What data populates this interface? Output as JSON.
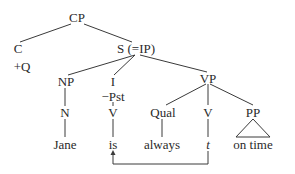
{
  "diagram": {
    "type": "syntax-tree",
    "nodes": {
      "cp": "CP",
      "c": "C",
      "c_feature": "+Q",
      "s": "S (=IP)",
      "np": "NP",
      "i": "I",
      "i_feature": "−Pst",
      "vp": "VP",
      "n": "N",
      "v_raised": "V",
      "qual": "Qual",
      "v": "V",
      "pp": "PP"
    },
    "words": {
      "jane": "Jane",
      "is": "is",
      "always": "always",
      "trace": "t",
      "on_time": "on time"
    },
    "movement": {
      "from": "t",
      "to": "is",
      "style": "arrow"
    },
    "colors": {
      "line": "#3a3a3a",
      "text": "#2a2a2a",
      "background": "#ffffff"
    }
  }
}
